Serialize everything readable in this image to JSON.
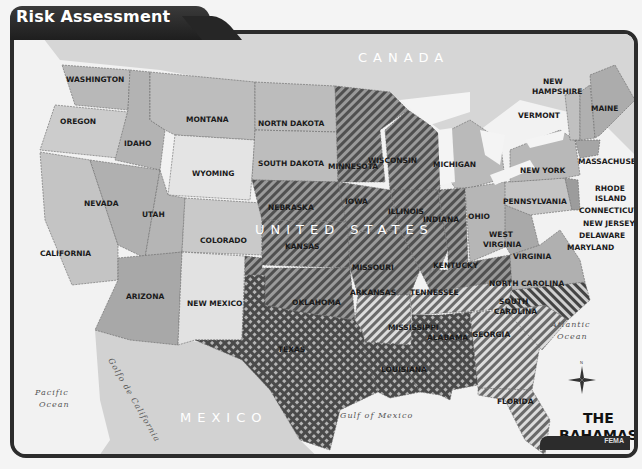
{
  "header": {
    "title": "Risk Assessment"
  },
  "footer": {
    "source": "FEMA"
  },
  "map": {
    "countries": {
      "canada": "CANADA",
      "usa": "UNITED STATES",
      "mexico": "MEXICO",
      "bahamas_line1": "THE",
      "bahamas_line2": "BAHAMAS"
    },
    "water": {
      "pacific_1": "Pacific",
      "pacific_2": "Ocean",
      "atlantic_1": "Atlantic",
      "atlantic_2": "Ocean",
      "gulf_mexico": "Gulf of Mexico",
      "gulf_california": "Golfo de California"
    },
    "states": {
      "washington": "WASHINGTON",
      "oregon": "OREGON",
      "california": "CALIFORNIA",
      "idaho": "IDAHO",
      "nevada": "NEVADA",
      "montana": "MONTANA",
      "wyoming": "WYOMING",
      "utah": "UTAH",
      "arizona": "ARIZONA",
      "colorado": "COLORADO",
      "new_mexico": "NEW MEXICO",
      "north_dakota": "NORTN DAKOTA",
      "south_dakota": "SOUTH DAKOTA",
      "nebraska": "NEBRASKA",
      "kansas": "KANSAS",
      "oklahoma": "OKLAHOMA",
      "texas": "TEXAS",
      "minnesota": "MINNESOTA",
      "iowa": "IOWA",
      "missouri": "MISSOURI",
      "arkansas": "ARKANSAS",
      "louisiana": "LOUISIANA",
      "wisconsin": "WISCONSIN",
      "illinois": "ILLINOIS",
      "michigan": "MICHIGAN",
      "indiana": "INDIANA",
      "ohio": "OHIO",
      "kentucky": "KENTUCKY",
      "tennessee": "TENNESSEE",
      "mississippi": "MISSISSIPPI",
      "alabama": "ALABAMA",
      "georgia": "GEORGIA",
      "florida": "FLORIDA",
      "south_carolina_1": "SOUTH",
      "south_carolina_2": "CAROLINA",
      "north_carolina": "NORTH CAROLINA",
      "virginia": "VIRGINIA",
      "west_virginia_1": "WEST",
      "west_virginia_2": "VIRGINIA",
      "pennsylvania": "PENNSYLVANIA",
      "new_york": "NEW YORK",
      "maryland": "MARYLAND",
      "delaware": "DELAWARE",
      "new_jersey": "NEW JERSEY",
      "connecticut": "CONNECTICUT",
      "rhode_island_1": "RHODE",
      "rhode_island_2": "ISLAND",
      "massachusetts": "MASSACHUSETTS",
      "vermont": "VERMONT",
      "new_hampshire_1": "NEW",
      "new_hampshire_2": "HAMPSHIRE",
      "maine": "MAINE"
    },
    "fills": {
      "water": "#f2f2f2",
      "foreign_land": "#d8d8d8",
      "light_state": "#e6e6e6",
      "mid_state": "#bfbfbf",
      "dark_state": "#a9a9a9",
      "hatch_dark": "#555555",
      "hatch_light": "#cfcfcf",
      "frame": "#2c2c2c"
    },
    "risk_categories": [
      {
        "pattern": "diagonal-hatch",
        "states": [
          "Nebraska",
          "Kansas",
          "Minnesota",
          "Iowa",
          "Wisconsin",
          "Illinois",
          "Indiana",
          "Missouri",
          "Kentucky",
          "Oklahoma"
        ]
      },
      {
        "pattern": "light-diagonal-hatch",
        "states": [
          "Arkansas",
          "Tennessee",
          "Georgia",
          "Florida",
          "South Carolina"
        ]
      },
      {
        "pattern": "reverse-hatch",
        "states": [
          "North Carolina"
        ]
      },
      {
        "pattern": "crosshatch",
        "states": [
          "Texas",
          "Louisiana",
          "Mississippi",
          "Alabama"
        ]
      }
    ]
  }
}
